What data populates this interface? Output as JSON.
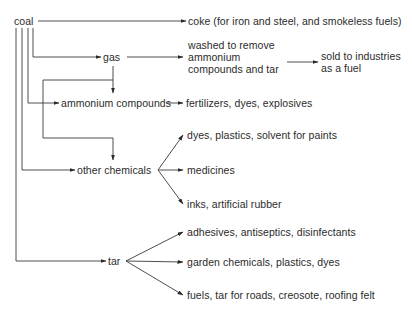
{
  "diagram": {
    "root": "coal",
    "nodes": {
      "coal": "coal",
      "coke": "coke (for iron and steel, and smokeless fuels)",
      "gas": "gas",
      "gas_wash_1": "washed to remove",
      "gas_wash_2": "ammonium",
      "gas_wash_3": "compounds and tar",
      "sold_1": "sold to industries",
      "sold_2": "as a fuel",
      "ammonium": "ammonium compounds",
      "ammonium_uses": "fertilizers, dyes, explosives",
      "other": "other chemicals",
      "other_uses_1": "dyes, plastics, solvent for paints",
      "other_uses_2": "medicines",
      "other_uses_3": "inks, artificial rubber",
      "tar": "tar",
      "tar_uses_1": "adhesives, antiseptics, disinfectants",
      "tar_uses_2": "garden chemicals, plastics, dyes",
      "tar_uses_3": "fuels, tar for roads, creosote, roofing felt"
    },
    "edges": [
      [
        "coal",
        "coke"
      ],
      [
        "coal",
        "gas"
      ],
      [
        "gas",
        "washed to remove ammonium compounds and tar"
      ],
      [
        "washed to remove ammonium compounds and tar",
        "sold to industries as a fuel"
      ],
      [
        "gas",
        "ammonium compounds"
      ],
      [
        "gas",
        "other chemicals"
      ],
      [
        "coal",
        "ammonium compounds"
      ],
      [
        "ammonium compounds",
        "fertilizers, dyes, explosives"
      ],
      [
        "coal",
        "other chemicals"
      ],
      [
        "other chemicals",
        "dyes, plastics, solvent for paints"
      ],
      [
        "other chemicals",
        "medicines"
      ],
      [
        "other chemicals",
        "inks, artificial rubber"
      ],
      [
        "coal",
        "tar"
      ],
      [
        "tar",
        "adhesives, antiseptics, disinfectants"
      ],
      [
        "tar",
        "garden chemicals, plastics, dyes"
      ],
      [
        "tar",
        "fuels, tar for roads, creosote, roofing felt"
      ]
    ]
  }
}
